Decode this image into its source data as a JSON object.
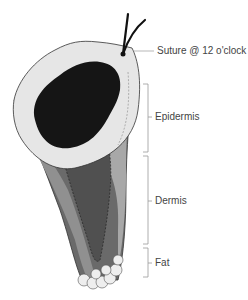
{
  "diagram": {
    "labels": {
      "suture": "Suture @ 12 o'clock",
      "epidermis": "Epidermis",
      "dermis": "Dermis",
      "fat": "Fat"
    },
    "colors": {
      "surface": "#e8e8e8",
      "lesion": "#1a1a1a",
      "dermis_dark": "#5a5a5a",
      "dermis_mid": "#808080",
      "dermis_light": "#a8a8a8",
      "fat": "#eeeeee",
      "bracket": "#888888"
    }
  }
}
